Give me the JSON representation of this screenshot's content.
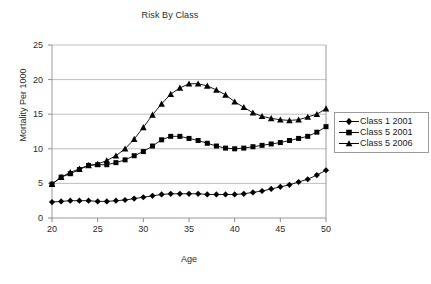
{
  "chart_data": {
    "type": "line",
    "title": "Risk By Class",
    "xlabel": "Age",
    "ylabel": "Mortality Per 1000",
    "xlim": [
      20,
      50
    ],
    "ylim": [
      0,
      25
    ],
    "xticks": [
      20,
      25,
      30,
      35,
      40,
      45,
      50
    ],
    "yticks": [
      0,
      5,
      10,
      15,
      20,
      25
    ],
    "grid": "horizontal",
    "legend_position": "right",
    "x": [
      20,
      21,
      22,
      23,
      24,
      25,
      26,
      27,
      28,
      29,
      30,
      31,
      32,
      33,
      34,
      35,
      36,
      37,
      38,
      39,
      40,
      41,
      42,
      43,
      44,
      45,
      46,
      47,
      48,
      49,
      50
    ],
    "series": [
      {
        "name": "Class 1 2001",
        "marker": "diamond",
        "values": [
          2.3,
          2.4,
          2.5,
          2.5,
          2.5,
          2.4,
          2.4,
          2.5,
          2.6,
          2.8,
          3.0,
          3.2,
          3.4,
          3.5,
          3.5,
          3.5,
          3.5,
          3.4,
          3.4,
          3.4,
          3.4,
          3.5,
          3.7,
          3.9,
          4.2,
          4.5,
          4.8,
          5.2,
          5.6,
          6.2,
          6.9
        ]
      },
      {
        "name": "Class 5 2001",
        "marker": "square",
        "values": [
          4.9,
          5.9,
          6.4,
          7.0,
          7.6,
          7.7,
          7.7,
          8.0,
          8.4,
          9.0,
          9.6,
          10.4,
          11.3,
          11.8,
          11.8,
          11.5,
          11.2,
          10.8,
          10.4,
          10.1,
          10.0,
          10.1,
          10.3,
          10.5,
          10.7,
          10.9,
          11.2,
          11.5,
          11.8,
          12.4,
          13.2
        ]
      },
      {
        "name": "Class 5 2006",
        "marker": "triangle",
        "values": [
          4.9,
          5.9,
          6.6,
          7.1,
          7.6,
          7.8,
          8.3,
          9.0,
          10.0,
          11.4,
          13.1,
          14.9,
          16.5,
          17.9,
          18.8,
          19.4,
          19.4,
          19.1,
          18.5,
          17.8,
          16.8,
          16.0,
          15.2,
          14.7,
          14.4,
          14.2,
          14.1,
          14.2,
          14.6,
          15.0,
          15.8
        ]
      }
    ]
  }
}
